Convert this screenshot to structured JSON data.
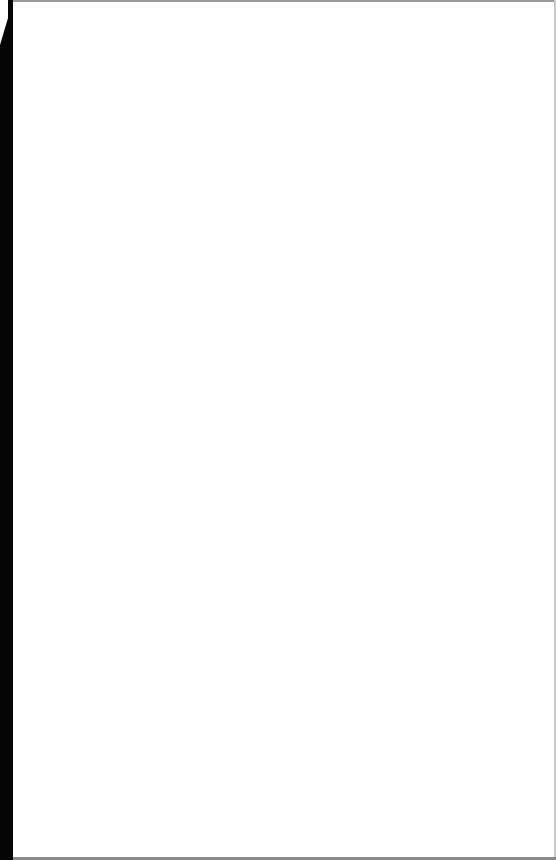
{
  "document": {
    "type": "blank-scanned-page",
    "text_content": "",
    "colors": {
      "paper": "#ffffff",
      "left_edge": "#050505",
      "top_edge": "#9a9a9a",
      "bottom_edge": "#8a8a8a",
      "right_edge": "#c8c8c8"
    }
  }
}
